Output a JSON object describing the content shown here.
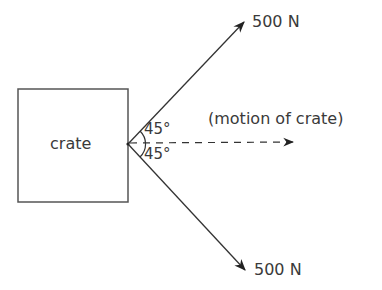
{
  "diagram": {
    "crate": {
      "label": "crate"
    },
    "forces": [
      {
        "label": "500 N",
        "direction": "up-right",
        "angle_label": "45°"
      },
      {
        "label": "500 N",
        "direction": "down-right",
        "angle_label": "45°"
      }
    ],
    "motion": {
      "label": "(motion of crate)",
      "style": "dashed-arrow"
    },
    "colors": {
      "stroke": "#333333",
      "text": "#3a3a3a",
      "background": "#ffffff"
    }
  }
}
